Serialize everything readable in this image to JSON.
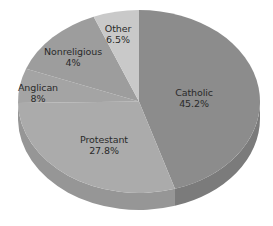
{
  "chart_data": {
    "type": "pie",
    "title": "",
    "style": "3d-tilted",
    "categories": [
      "Catholic",
      "Protestant",
      "Anglican",
      "Nonreligious",
      "Other"
    ],
    "values": [
      45.2,
      27.8,
      8,
      4,
      6.5
    ],
    "value_labels": [
      "45.2%",
      "27.8%",
      "8%",
      "4%",
      "6.5%"
    ],
    "colors": [
      "#8c8c8c",
      "#ababab",
      "#a4a4a4",
      "#9d9d9d",
      "#c9c9c9"
    ],
    "depth_colors": [
      "#7b7b7b",
      "#969696",
      "#909090",
      "#8a8a8a",
      "#b0b0b0"
    ],
    "start_angles_deg": [
      -90,
      72.7,
      179,
      201,
      248
    ],
    "end_angles_deg": [
      72.7,
      179,
      201,
      248,
      270
    ],
    "legend": "none (labels inside slices)",
    "geometry": {
      "cx": 139,
      "cy": 101.5,
      "rx": 121,
      "ry": 91.5,
      "depth": 17
    },
    "label_positions": [
      {
        "x": 194,
        "y": 98
      },
      {
        "x": 104,
        "y": 145
      },
      {
        "x": 38,
        "y": 93
      },
      {
        "x": 73,
        "y": 57
      },
      {
        "x": 118,
        "y": 34
      }
    ]
  },
  "labels": [
    {
      "name": "Catholic",
      "value": "45.2%"
    },
    {
      "name": "Protestant",
      "value": "27.8%"
    },
    {
      "name": "Anglican",
      "value": "8%"
    },
    {
      "name": "Nonreligious",
      "value": "4%"
    },
    {
      "name": "Other",
      "value": "6.5%"
    }
  ]
}
